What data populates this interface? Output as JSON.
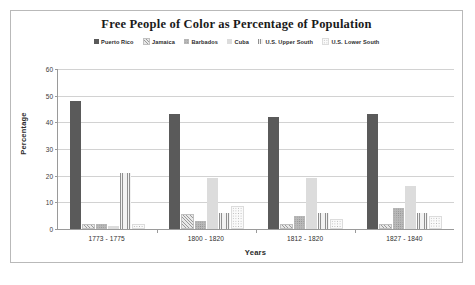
{
  "chart_data": {
    "type": "bar",
    "title": "Free People of Color as Percentage of Population",
    "xlabel": "Years",
    "ylabel": "Percentage",
    "ylim": [
      0,
      60
    ],
    "yticks": [
      0,
      10,
      20,
      30,
      40,
      50,
      60
    ],
    "grid": true,
    "legend_position": "top",
    "categories": [
      "1773 - 1775",
      "1800 - 1820",
      "1812 - 1820",
      "1827 - 1840"
    ],
    "series": [
      {
        "name": "Puerto Rico",
        "values": [
          48,
          43,
          42,
          43
        ]
      },
      {
        "name": "Jamaica",
        "values": [
          1,
          5,
          1,
          1
        ]
      },
      {
        "name": "Barbados",
        "values": [
          2,
          3,
          5,
          8
        ]
      },
      {
        "name": "Cuba",
        "values": [
          1,
          19,
          19,
          16
        ]
      },
      {
        "name": "U.S. Upper South",
        "values": [
          21,
          6,
          6,
          6
        ]
      },
      {
        "name": "U.S. Lower South",
        "values": [
          1,
          8,
          3,
          4
        ]
      }
    ]
  },
  "legend": {
    "items": [
      {
        "label": "Puerto Rico"
      },
      {
        "label": "Jamaica"
      },
      {
        "label": "Barbados"
      },
      {
        "label": "Cuba"
      },
      {
        "label": "U.S. Upper South"
      },
      {
        "label": "U.S. Lower South"
      }
    ]
  }
}
